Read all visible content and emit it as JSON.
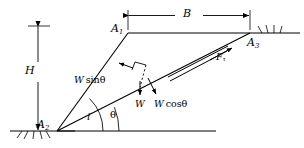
{
  "figure": {
    "type": "engineering-diagram",
    "width": 304,
    "height": 148,
    "background": "#ffffff",
    "line_color": "#000000",
    "text_color": "#000000"
  },
  "points": {
    "a1": {
      "label": "A",
      "sub": "1",
      "x": 128,
      "y": 33,
      "label_x": 111,
      "label_y": 23
    },
    "a2": {
      "label": "A",
      "sub": "2",
      "x": 57,
      "y": 131,
      "label_x": 37,
      "label_y": 119
    },
    "a3": {
      "label": "A",
      "sub": "3",
      "x": 250,
      "y": 33,
      "label_x": 247,
      "label_y": 37
    }
  },
  "dimensions": {
    "b": {
      "label": "B",
      "x1": 128,
      "x2": 250,
      "y": 15,
      "label_x": 183,
      "label_y": 8
    },
    "h": {
      "label": "H",
      "x": 38,
      "y1": 26,
      "y2": 131,
      "label_x": 25,
      "label_y": 71
    }
  },
  "angles": {
    "i": {
      "label": "i",
      "value_x": 87,
      "value_y": 118,
      "radius": 46
    },
    "theta": {
      "label": "θ",
      "value_x": 110,
      "value_y": 116,
      "radius": 62
    }
  },
  "forces": [
    {
      "name": "w-sin-theta",
      "label_main": "W",
      "label_fn": "sin",
      "label_arg": "θ",
      "x": 39,
      "y": 79,
      "desc": "driving component along slip plane, arrow up-slope"
    },
    {
      "name": "w",
      "label_main": "W",
      "label_fn": "",
      "label_arg": "",
      "x": 136,
      "y": 104,
      "desc": "total weight, arrow vertically down"
    },
    {
      "name": "w-cos-theta",
      "label_main": "W",
      "label_fn": "cos",
      "label_arg": "θ",
      "x": 156,
      "y": 104,
      "desc": "normal component, arrow down-right"
    },
    {
      "name": "f-tau",
      "label_main": "F",
      "label_fn": "",
      "label_arg": "",
      "sub": "τ",
      "x": 218,
      "y": 54,
      "desc": "shear resistance along slip surface, arrow up-slope"
    }
  ],
  "ground": {
    "left_line": {
      "x1": 10,
      "x2": 75,
      "y": 131
    },
    "right_line": {
      "x1": 250,
      "x2": 300,
      "y": 33
    },
    "base_line": {
      "x1": 57,
      "x2": 216,
      "y": 131
    },
    "hatch_label": "ground-hatching"
  }
}
